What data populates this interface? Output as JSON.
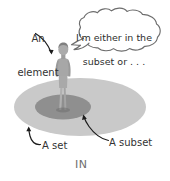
{
  "figure": {
    "caption": "IN",
    "labels": {
      "element": "An\nelement",
      "element_line1": "An",
      "element_line2": "element",
      "set": "A set",
      "subset": "A subset"
    },
    "speech_bubble": {
      "text": "I'm either in the\nsubset or . . .",
      "line1": "I'm either in the",
      "line2": "subset or . . ."
    },
    "colors": {
      "background": "#ffffff",
      "set_fill": "#c8c8c8",
      "subset_fill": "#8e8e8e",
      "person_fill": "#a8a8a8",
      "person_shade": "#8f8f8f",
      "bubble_stroke": "#6b6b6b",
      "bubble_fill": "#ffffff",
      "arrow_stroke": "#1f1f1f",
      "label_text": "#333333",
      "caption_text": "#6e6e6e"
    }
  }
}
